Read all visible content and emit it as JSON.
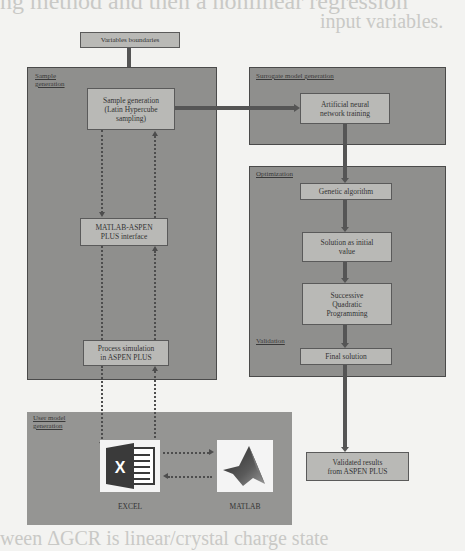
{
  "background_text": {
    "top_line_1": "ng method and then a nonlinear regression ",
    "top_line_2": "input variables.",
    "bottom_line": "ween ΔGCR is linear/crystal charge state"
  },
  "diagram": {
    "variables_boundaries": "Variables boundaries",
    "panels": {
      "sample_generation": "Sample\ngeneration",
      "surrogate_model": "Surrogate model generation",
      "optimization": "Optimization",
      "validation": "Validation",
      "user_model": "User model\ngeneration"
    },
    "boxes": {
      "sample_gen": "Sample generation\n(Latin Hypercube\nsampling)",
      "matlab_aspen": "MATLAB-ASPEN\nPLUS interface",
      "process_sim": "Process simulation\nin ASPEN PLUS",
      "ann": "Artificial neural\nnetwork training",
      "genetic": "Genetic algorithm",
      "solution_initial": "Solution as initial\nvalue",
      "sqp": "Successive\nQuadratic\nProgramming",
      "final": "Final solution",
      "validated": "Validated results\nfrom ASPEN PLUS"
    },
    "icons": {
      "excel_label": "EXCEL",
      "matlab_label": "MATLAB",
      "excel_glyph": "X"
    },
    "colors": {
      "panel": "#8f8f8d",
      "box": "#b9b9b6",
      "arrow": "#555555",
      "excel_green": "#3a3a3a"
    }
  }
}
